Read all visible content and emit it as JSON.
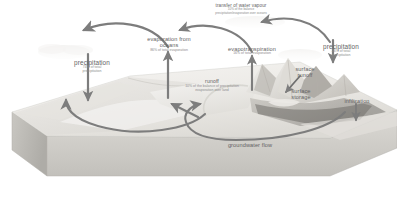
{
  "diagram": {
    "colors": {
      "arrow": "#7d7d7d",
      "label_primary": "#636363",
      "label_secondary": "#8d8d8d",
      "block_top": "#f0efed",
      "block_front": "#cfcdc9",
      "block_side": "#b9b7b3",
      "background": "#ffffff",
      "terrain_light": "#eceae6",
      "terrain_mid": "#c9c6c0",
      "terrain_dark": "#8f8c87",
      "water": "#e4e3e0"
    }
  },
  "labels": {
    "transfer_water_vapour": {
      "title": "transfer of water vapour",
      "detail_line1": "10% of the balance",
      "detail_line2": "precipitation/evaporation over oceans"
    },
    "precipitation_ocean": {
      "title": "precipitation",
      "detail_line1": "74% of total",
      "detail_line2": "precipitation"
    },
    "evaporation_oceans": {
      "title": "evaporation from",
      "title_line2": "oceans",
      "detail_line1": "86% of total evaporation"
    },
    "evapotranspiration": {
      "title": "evapotranspiration",
      "detail_line1": "16% of total evaporation"
    },
    "precipitation_land": {
      "title": "precipitation",
      "detail_line1": "26% of total",
      "detail_line2": "precipitation"
    },
    "runoff": {
      "title": "runoff",
      "detail_line1": "10% of the balance of precipitation",
      "detail_line2": "evaporation over land"
    },
    "surface_runoff": {
      "title_line1": "surface",
      "title_line2": "runoff"
    },
    "surface_storage": {
      "title_line1": "surface",
      "title_line2": "storage"
    },
    "infiltration": {
      "title": "infiltration"
    },
    "groundwater_flow": {
      "title": "groundwater flow"
    }
  }
}
